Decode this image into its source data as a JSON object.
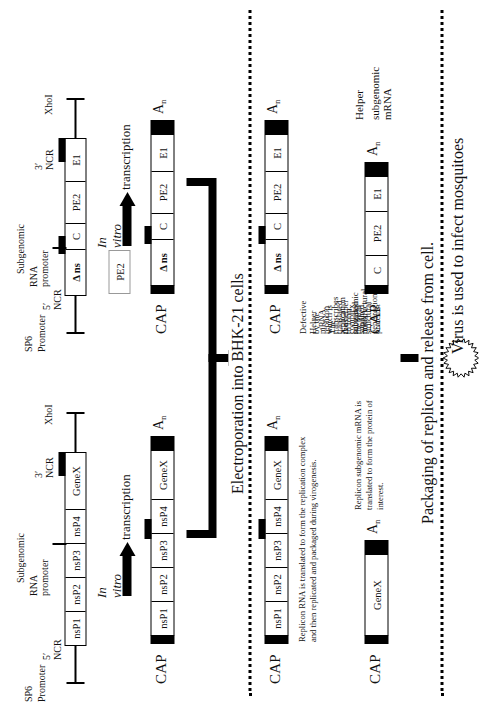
{
  "figure": {
    "orientation": "rotated-90"
  },
  "replicon": {
    "section_name": "Replicon construct",
    "dna_labels": {
      "sp6": "SP6",
      "promoter": "Promoter",
      "ncr5": "5′ NCR",
      "subgenomic_line1": "Subgenomic",
      "subgenomic_line2": "RNA promoter",
      "ncr3": "3′ NCR",
      "xhoi": "XhoI"
    },
    "construct_segments": [
      "nsP1",
      "nsP2",
      "nsP3",
      "nsP4",
      "GeneX"
    ],
    "transcription": {
      "line1": "In vitro",
      "line2": "transcription"
    },
    "rna": {
      "cap": "CAP",
      "segments": [
        "nsP1",
        "nsP2",
        "nsP3",
        "nsP4",
        "GeneX"
      ],
      "polya": "A",
      "polya_sub": "n"
    },
    "in_cell_rna": {
      "cap": "CAP",
      "segments": [
        "nsP1",
        "nsP2",
        "nsP3",
        "nsP4",
        "GeneX"
      ],
      "polya": "A",
      "polya_sub": "n"
    },
    "in_cell_caption": "Replicon RNA is translated to form the replication complex and then replicated and packaged during virogenesis.",
    "subgenomic": {
      "cap": "CAP",
      "segments": [
        "GeneX"
      ],
      "polya": "A",
      "polya_sub": "n"
    },
    "subgenomic_caption": "Replicon subgenomic mRNA is translated to form the protein of interest."
  },
  "helper": {
    "section_name": "Defective helper construct",
    "dna_labels": {
      "sp6": "SP6",
      "promoter": "Promoter",
      "ncr5": "5′ NCR",
      "subgenomic_line1": "Subgenomic",
      "subgenomic_line2": "RNA promoter",
      "ncr3": "3′ NCR",
      "xhoi": "XhoI"
    },
    "construct_segments": [
      "Δ ns",
      "C",
      "PE2",
      "E1"
    ],
    "pe2_box": "PE2",
    "transcription": {
      "line1": "In vitro",
      "line2": "transcription"
    },
    "rna": {
      "cap": "CAP",
      "segments": [
        "Δ ns",
        "C",
        "PE2",
        "E1"
      ],
      "polya": "A",
      "polya_sub": "n"
    },
    "in_cell_rna": {
      "cap": "CAP",
      "segments": [
        "Δ ns",
        "C",
        "PE2",
        "E1"
      ],
      "polya": "A",
      "polya_sub": "n"
    },
    "in_cell_caption_l1": "Defective Helper mRNA. The replication complex supplied",
    "in_cell_caption_l2": "by the replicon transcribes the helper subgenomic mRNA",
    "in_cell_caption_l3": "which is translated to form the viral structural proteins.",
    "in_cell_caption_l4": "Δ ns = truncated nonstructural gene region.",
    "subgenomic": {
      "cap": "CAP",
      "segments": [
        "C",
        "PE2",
        "E1"
      ],
      "polya": "A",
      "polya_sub": "n"
    },
    "subgenomic_caption_l1": "Helper",
    "subgenomic_caption_l2": "subgenomic mRNA"
  },
  "steps": {
    "electroporation": "Electroporation into BHK-21 cells",
    "packaging": "Packaging of replicon and release from cell.",
    "infection": "Virus is used to infect mosquitoes"
  }
}
